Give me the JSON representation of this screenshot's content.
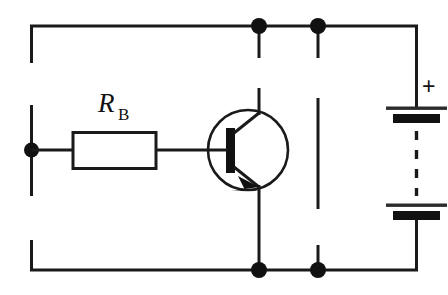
{
  "figure": {
    "type": "schematic-diagram",
    "background_color": "#ffffff",
    "line_color": "#1a1a1a"
  },
  "labels": {
    "resistor_symbol": "R",
    "resistor_subscript": "B",
    "battery_polarity": "+"
  },
  "components": {
    "resistor": {
      "name": "base resistor",
      "designator": "R_B"
    },
    "transistor": {
      "name": "NPN bipolar junction transistor",
      "terminals": [
        "base",
        "collector",
        "emitter"
      ]
    },
    "battery": {
      "name": "DC supply battery",
      "positive_terminal": "top",
      "cells": 2
    },
    "input_terminal": {
      "name": "base input terminal"
    }
  },
  "nodes": [
    {
      "name": "top-collector-node"
    },
    {
      "name": "top-supply-node"
    },
    {
      "name": "bottom-emitter-node"
    },
    {
      "name": "bottom-supply-node"
    },
    {
      "name": "base-input-node"
    }
  ]
}
